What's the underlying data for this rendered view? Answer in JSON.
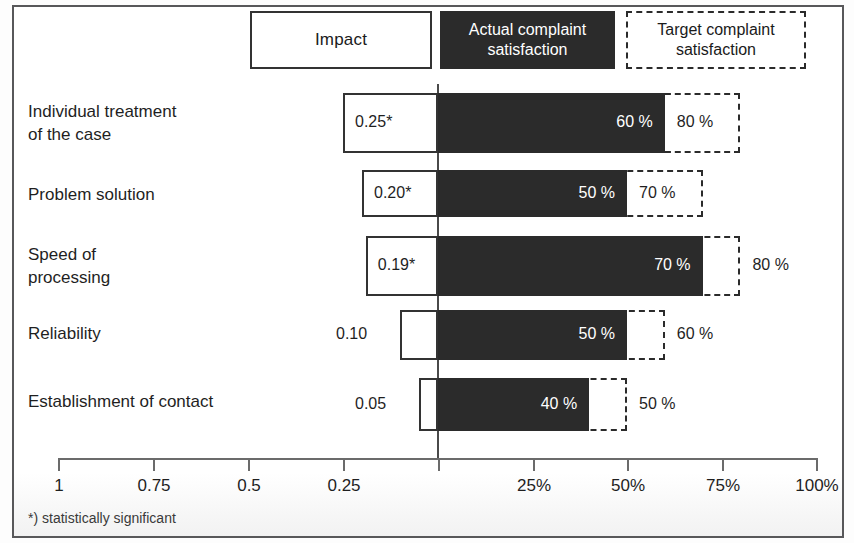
{
  "legend": {
    "impact": "Impact",
    "actual": "Actual complaint satisfaction",
    "target": "Target complaint satisfaction"
  },
  "footnote": "*) statistically significant",
  "chart_data": {
    "type": "bar",
    "title": "",
    "subtitle": "",
    "orientation": "horizontal-diverging",
    "xlabel": "",
    "ylabel": "",
    "grid": false,
    "legend_position": "top",
    "legend_entries": [
      "Impact",
      "Actual complaint satisfaction",
      "Target complaint satisfaction"
    ],
    "left_axis": {
      "name": "Impact",
      "ticks": [
        "1",
        "0.75",
        "0.5",
        "0.25"
      ],
      "tick_values": [
        1,
        0.75,
        0.5,
        0.25
      ],
      "range": [
        1,
        0
      ]
    },
    "right_axis": {
      "name": "Complaint satisfaction",
      "ticks": [
        "25%",
        "50%",
        "75%",
        "100%"
      ],
      "tick_values": [
        25,
        50,
        75,
        100
      ],
      "range": [
        0,
        100
      ]
    },
    "categories": [
      "Individual treatment\nof the case",
      "Problem solution",
      "Speed of\nprocessing",
      "Reliability",
      "Establishment of contact"
    ],
    "series": [
      {
        "name": "Impact",
        "values": [
          0.25,
          0.2,
          0.19,
          0.1,
          0.05
        ]
      },
      {
        "name": "Actual complaint satisfaction",
        "values": [
          60,
          50,
          70,
          50,
          40
        ]
      },
      {
        "name": "Target complaint satisfaction",
        "values": [
          80,
          70,
          80,
          60,
          50
        ]
      }
    ],
    "annotations": {
      "significant": [
        true,
        true,
        true,
        false,
        false
      ],
      "significance_marker": "*"
    }
  },
  "rows": [
    {
      "label": "Individual treatment\nof the case",
      "impact_label": "0.25*",
      "impact_label_inside": true,
      "actual_label": "60 %",
      "target_label": "80 %",
      "target_label_inside": true
    },
    {
      "label": "Problem solution",
      "impact_label": "0.20*",
      "impact_label_inside": true,
      "actual_label": "50 %",
      "target_label": "70 %",
      "target_label_inside": true
    },
    {
      "label": "Speed of\nprocessing",
      "impact_label": "0.19*",
      "impact_label_inside": true,
      "actual_label": "70 %",
      "target_label": "80 %",
      "target_label_inside": false
    },
    {
      "label": "Reliability",
      "impact_label": "0.10",
      "impact_label_inside": false,
      "actual_label": "50 %",
      "target_label": "60 %",
      "target_label_inside": false
    },
    {
      "label": "Establishment of contact",
      "impact_label": "0.05",
      "impact_label_inside": false,
      "actual_label": "40 %",
      "target_label": "50 %",
      "target_label_inside": false
    }
  ],
  "axis": {
    "ticks": [
      "1",
      "0.75",
      "0.5",
      "0.25",
      "25%",
      "50%",
      "75%",
      "100%"
    ]
  },
  "colors": {
    "actual_fill": "#2b2b2b",
    "impact_fill": "#ffffff",
    "stroke": "#333333",
    "frame": "#58585a"
  }
}
